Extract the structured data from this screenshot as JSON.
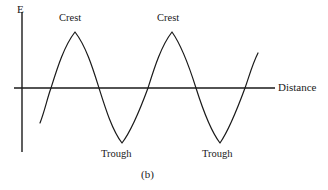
{
  "figure": {
    "caption": "(b)",
    "axes": {
      "y_axis_label": "E",
      "x_axis_label": "Distance"
    },
    "annotations": {
      "crest_1": "Crest",
      "crest_2": "Crest",
      "trough_1": "Trough",
      "trough_2": "Trough"
    },
    "colors": {
      "background": "#ffffff",
      "curve": "#1a1a1a",
      "axis": "#1a1a1a",
      "text": "#1a1a1a"
    }
  },
  "chart_data": {
    "type": "line",
    "title": "(b)",
    "xlabel": "Distance",
    "ylabel": "E",
    "grid": false,
    "legend": null,
    "axis_geometry": {
      "x_axis_y_px": 88,
      "x_axis_start_px": 14,
      "x_axis_end_px": 275,
      "y_axis_x_px": 22,
      "y_axis_top_px": 12,
      "y_axis_bottom_px": 152
    },
    "curve_extent_px": {
      "x_start": 40,
      "y_start": 123,
      "x_end": 258,
      "y_end": 53
    },
    "wave": {
      "amplitude_px": 56,
      "wavelength_px": 97,
      "baseline_px": 88,
      "crest_points_px": [
        [
          75,
          32
        ],
        [
          172,
          32
        ]
      ],
      "trough_points_px": [
        [
          122,
          143
        ],
        [
          220,
          143
        ]
      ],
      "zero_crossings_px": [
        51,
        99,
        148,
        196,
        245
      ]
    },
    "annotation_positions_px": {
      "crest_1": [
        59,
        13
      ],
      "crest_2": [
        157,
        13
      ],
      "trough_1": [
        101,
        149
      ],
      "trough_2": [
        202,
        149
      ],
      "y_axis_label": [
        17,
        4
      ],
      "x_axis_label": [
        278,
        82
      ],
      "caption": [
        141,
        169
      ]
    },
    "path_d": "M 40 123 C 45 110 47 99 51 88 C 57 69 64 46 75 32 C 86 46 93 69 99 88 C 105 107 112 130 122 143 C 132 130 141 107 148 88 C 154 69 161 46 172 32 C 182 46 190 69 196 88 C 202 107 210 130 220 143 C 229 130 238 107 245 88 C 249 77 252 65 258 53"
  }
}
